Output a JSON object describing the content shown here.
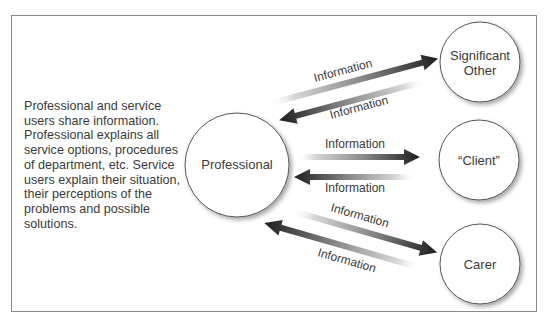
{
  "description": "Professional and service users share information. Professional explains all service options, procedures of department, etc. Service users explain their situation, their perceptions of the problems and possible solutions.",
  "nodes": {
    "professional": {
      "label": "Professional"
    },
    "significant_other": {
      "line1": "Significant",
      "line2": "Other"
    },
    "client": {
      "label": "“Client”"
    },
    "carer": {
      "label": "Carer"
    }
  },
  "edges": {
    "to_significant_other": {
      "label": "Information"
    },
    "from_significant_other": {
      "label": "Information"
    },
    "to_client": {
      "label": "Information"
    },
    "from_client": {
      "label": "Information"
    },
    "to_carer": {
      "label": "Information"
    },
    "from_carer": {
      "label": "Information"
    }
  },
  "colors": {
    "arrow_dark": "#222222",
    "arrow_light": "#e6e6e6",
    "circle_stroke": "#555555",
    "frame": "#8a8a8a"
  }
}
